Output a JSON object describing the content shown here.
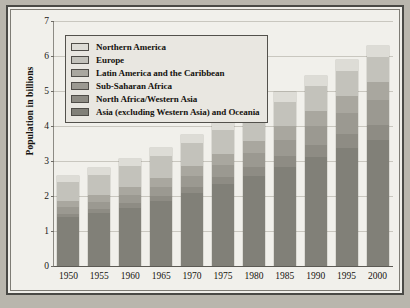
{
  "chart_data": {
    "type": "bar",
    "subtype": "stacked-vertical",
    "title": "",
    "xlabel": "",
    "ylabel": "Population in billions",
    "ylim": [
      0,
      7
    ],
    "yticks": [
      "0",
      "1",
      "2",
      "3",
      "4",
      "5",
      "6",
      "7"
    ],
    "grid": true,
    "legend_position": "top-left-inside",
    "categories": [
      "1950",
      "1955",
      "1960",
      "1965",
      "1970",
      "1975",
      "1980",
      "1985",
      "1990",
      "1995",
      "2000"
    ],
    "series": [
      {
        "name": "Asia (excluding Western Asia) and Oceania",
        "color": "#818078",
        "values": [
          1.39,
          1.51,
          1.66,
          1.85,
          2.09,
          2.34,
          2.58,
          2.84,
          3.12,
          3.37,
          3.6
        ]
      },
      {
        "name": "North Africa/Western Asia",
        "color": "#8e8c84",
        "values": [
          0.11,
          0.12,
          0.14,
          0.16,
          0.18,
          0.21,
          0.25,
          0.29,
          0.34,
          0.39,
          0.44
        ]
      },
      {
        "name": "Sub-Saharan Africa",
        "color": "#9b9991",
        "values": [
          0.18,
          0.2,
          0.23,
          0.26,
          0.3,
          0.34,
          0.39,
          0.46,
          0.53,
          0.61,
          0.69
        ]
      },
      {
        "name": "Latin America and the Caribbean",
        "color": "#a9a79f",
        "values": [
          0.17,
          0.19,
          0.22,
          0.25,
          0.29,
          0.32,
          0.36,
          0.4,
          0.44,
          0.48,
          0.52
        ]
      },
      {
        "name": "Europe",
        "color": "#c3c2bb",
        "values": [
          0.55,
          0.58,
          0.6,
          0.63,
          0.66,
          0.68,
          0.69,
          0.71,
          0.72,
          0.73,
          0.73
        ]
      },
      {
        "name": "Northern America",
        "color": "#dddcd6",
        "values": [
          0.17,
          0.19,
          0.2,
          0.22,
          0.23,
          0.24,
          0.25,
          0.27,
          0.28,
          0.3,
          0.31
        ]
      }
    ],
    "totals": [
      2.57,
      2.79,
      3.05,
      3.37,
      3.75,
      4.13,
      4.52,
      4.97,
      5.43,
      5.88,
      6.29
    ]
  },
  "legend": {
    "items": [
      {
        "label": "Northern America",
        "color": "#dddcd6"
      },
      {
        "label": "Europe",
        "color": "#c3c2bb"
      },
      {
        "label": "Latin America and the Caribbean",
        "color": "#a9a79f"
      },
      {
        "label": "Sub-Saharan Africa",
        "color": "#9b9991"
      },
      {
        "label": "North Africa/Western Asia",
        "color": "#8e8c84"
      },
      {
        "label": "Asia (excluding Western Asia) and Oceania",
        "color": "#818078"
      }
    ]
  }
}
